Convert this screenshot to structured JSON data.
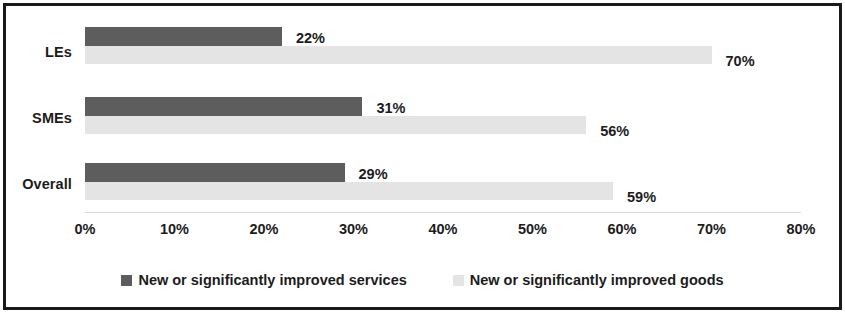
{
  "chart_data": {
    "type": "bar",
    "orientation": "horizontal",
    "title": "",
    "xlabel": "",
    "ylabel": "",
    "xlim": [
      0,
      80
    ],
    "xticks": [
      "0%",
      "10%",
      "20%",
      "30%",
      "40%",
      "50%",
      "60%",
      "70%",
      "80%"
    ],
    "xtick_values": [
      0,
      10,
      20,
      30,
      40,
      50,
      60,
      70,
      80
    ],
    "categories": [
      "LEs",
      "SMEs",
      "Overall"
    ],
    "grid": false,
    "legend_position": "bottom",
    "series": [
      {
        "name": "New or significantly improved services",
        "color": "#5d5d5d",
        "values": [
          22,
          31,
          29
        ],
        "labels": [
          "22%",
          "31%",
          "29%"
        ]
      },
      {
        "name": "New or significantly improved goods",
        "color": "#e4e4e4",
        "values": [
          70,
          56,
          59
        ],
        "labels": [
          "70%",
          "56%",
          "59%"
        ]
      }
    ]
  },
  "frame": {
    "border_color": "#1a1a1a",
    "background": "#ffffff"
  }
}
